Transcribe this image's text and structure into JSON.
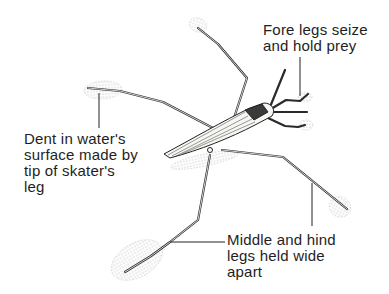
{
  "diagram": {
    "labels": {
      "fore_legs": "Fore legs seize\nand hold prey",
      "dent": "Dent in water's\nsurface made by\ntip of skater's\nleg",
      "mid_hind_legs": "Middle and hind\nlegs held wide\napart"
    },
    "colors": {
      "background": "#ffffff",
      "ink": "#1e1e1e",
      "leg_fill": "#d8d8d0",
      "dimple": "#bdbdbd"
    }
  }
}
